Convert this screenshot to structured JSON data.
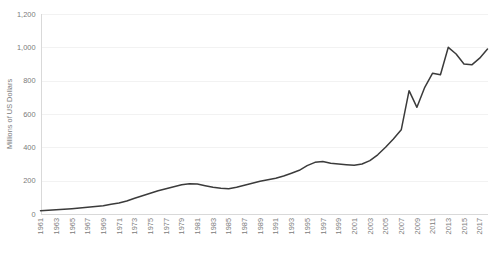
{
  "chart": {
    "y_axis_title": "Millions of US Dollars",
    "line_color": "#3b3b3b",
    "gridline_color": "#f2f2f2",
    "axis_color": "#d9d9d9",
    "tick_label_color": "#7b7b7b"
  },
  "chart_data": {
    "type": "line",
    "title": "",
    "subtitle": "",
    "xlabel": "",
    "ylabel": "Millions of US Dollars",
    "ylim": [
      0,
      1200
    ],
    "ytick_values": [
      0,
      200,
      400,
      600,
      800,
      1000,
      1200
    ],
    "ytick_labels": [
      "0",
      "200",
      "400",
      "600",
      "800",
      "1,000",
      "1,200"
    ],
    "xtick_labels": [
      "1961",
      "1963",
      "1965",
      "1967",
      "1969",
      "1971",
      "1973",
      "1975",
      "1977",
      "1979",
      "1981",
      "1983",
      "1985",
      "1987",
      "1989",
      "1991",
      "1993",
      "1995",
      "1997",
      "1999",
      "2001",
      "2003",
      "2005",
      "2007",
      "2009",
      "2011",
      "2013",
      "2015",
      "2017"
    ],
    "grid": true,
    "legend": false,
    "legend_position": "none",
    "x": [
      1961,
      1962,
      1963,
      1964,
      1965,
      1966,
      1967,
      1968,
      1969,
      1970,
      1971,
      1972,
      1973,
      1974,
      1975,
      1976,
      1977,
      1978,
      1979,
      1980,
      1981,
      1982,
      1983,
      1984,
      1985,
      1986,
      1987,
      1988,
      1989,
      1990,
      1991,
      1992,
      1993,
      1994,
      1995,
      1996,
      1997,
      1998,
      1999,
      2000,
      2001,
      2002,
      2003,
      2004,
      2005,
      2006,
      2007,
      2008,
      2009,
      2010,
      2011,
      2012,
      2013,
      2014,
      2015,
      2016,
      2017,
      2018
    ],
    "series": [
      {
        "name": "Millions of US Dollars",
        "values": [
          20,
          22,
          25,
          28,
          32,
          36,
          40,
          45,
          50,
          58,
          66,
          78,
          95,
          110,
          125,
          140,
          152,
          163,
          175,
          182,
          180,
          170,
          160,
          155,
          152,
          160,
          172,
          185,
          196,
          205,
          215,
          228,
          245,
          262,
          290,
          310,
          315,
          305,
          300,
          296,
          292,
          300,
          320,
          355,
          400,
          450,
          505,
          740,
          640,
          760,
          845,
          835,
          1000,
          960,
          900,
          895,
          935,
          990
        ]
      }
    ]
  }
}
